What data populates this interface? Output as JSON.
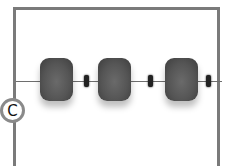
{
  "figure": {
    "label": "C",
    "large_bead_count": 3,
    "small_bead_count": 3,
    "colors": {
      "frame": "#7a7a7a",
      "bead_large": "#555555",
      "bead_small": "#222222",
      "string": "#6e6e6e"
    }
  }
}
